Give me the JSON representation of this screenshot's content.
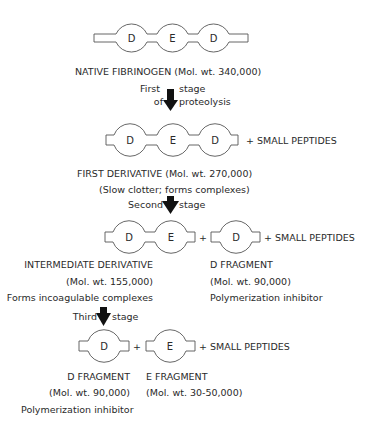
{
  "stage0": {
    "domains": [
      "D",
      "E",
      "D"
    ],
    "name": "NATIVE FIBRINOGEN (Mol. wt. 340,000)"
  },
  "arrow1": {
    "label_line1_left": "First",
    "label_line1_right": "stage",
    "label_line2_left": "of",
    "label_line2_right": "proteolysis"
  },
  "stage1": {
    "domains": [
      "D",
      "E",
      "D"
    ],
    "plus": "+ SMALL PEPTIDES",
    "name": "FIRST DERIVATIVE   (Mol. wt. 270,000)",
    "note": "(Slow clotter; forms complexes)"
  },
  "arrow2": {
    "label_left": "Second",
    "label_right": "stage"
  },
  "stage2": {
    "left_domains": [
      "D",
      "E"
    ],
    "plus1": "+",
    "right_domain": "D",
    "plus2": "+ SMALL PEPTIDES",
    "left_name": "INTERMEDIATE DERIVATIVE",
    "left_mw": "(Mol. wt. 155,000)",
    "left_note": "Forms incoagulable complexes",
    "right_name": "D FRAGMENT",
    "right_mw": "(Mol. wt. 90,000)",
    "right_note": "Polymerization inhibitor"
  },
  "arrow3": {
    "label_left": "Third",
    "label_right": "stage"
  },
  "stage3": {
    "left_domain": "D",
    "plus1": "+",
    "right_domain": "E",
    "plus2": "+ SMALL PEPTIDES",
    "left_name": "D FRAGMENT",
    "left_mw": "(Mol. wt. 90,000)",
    "left_note": "Polymerization inhibitor",
    "right_name": "E FRAGMENT",
    "right_mw": "(Mol. wt. 30-50,000)"
  }
}
